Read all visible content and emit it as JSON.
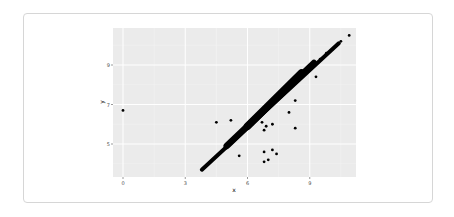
{
  "chart_data": {
    "type": "scatter",
    "title": "",
    "xlabel": "x",
    "ylabel": "y",
    "x_ticks": [
      0,
      3,
      6,
      9
    ],
    "y_ticks": [
      5,
      7,
      9
    ],
    "xlim": [
      -0.5,
      11.2
    ],
    "ylim": [
      3.2,
      10.7
    ],
    "grid": true,
    "legend": null,
    "background": "#ebebeb",
    "point_color": "#000000",
    "main_trend": {
      "description": "dense band of points along y ≈ x",
      "x_range": [
        3.8,
        10.4
      ],
      "y_range": [
        3.7,
        10.1
      ]
    },
    "points": [
      {
        "x": 0.0,
        "y": 6.7
      },
      {
        "x": 10.9,
        "y": 10.5
      },
      {
        "x": 10.5,
        "y": 10.2
      },
      {
        "x": 10.3,
        "y": 10.0
      },
      {
        "x": 10.1,
        "y": 9.8
      },
      {
        "x": 9.8,
        "y": 9.6
      },
      {
        "x": 9.5,
        "y": 9.3
      },
      {
        "x": 9.3,
        "y": 8.4
      },
      {
        "x": 8.3,
        "y": 7.2
      },
      {
        "x": 8.0,
        "y": 6.6
      },
      {
        "x": 8.3,
        "y": 5.8
      },
      {
        "x": 4.5,
        "y": 6.1
      },
      {
        "x": 5.2,
        "y": 6.2
      },
      {
        "x": 6.9,
        "y": 5.9
      },
      {
        "x": 7.2,
        "y": 6.0
      },
      {
        "x": 6.7,
        "y": 6.1
      },
      {
        "x": 6.8,
        "y": 5.7
      },
      {
        "x": 5.6,
        "y": 4.4
      },
      {
        "x": 6.8,
        "y": 4.6
      },
      {
        "x": 7.2,
        "y": 4.7
      },
      {
        "x": 6.8,
        "y": 4.1
      },
      {
        "x": 7.0,
        "y": 4.2
      },
      {
        "x": 7.4,
        "y": 4.5
      }
    ]
  }
}
